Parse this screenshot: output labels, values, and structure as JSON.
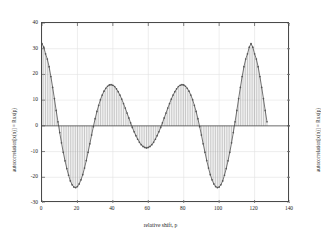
{
  "figure": {
    "background": "#ffffff",
    "axis_color": "#4a4a4a",
    "grid_color": "#e2e2e2",
    "stem_color": "#9a9a9a",
    "marker_color": "#555555",
    "curve_color": "#3a3a3a"
  },
  "chart_data": {
    "type": "bar",
    "title": "",
    "xlabel": "relative shift, p",
    "ylabel": "autocorrelation[x(n)] = Rxx(p)",
    "ylabel_right": "autocorrelation[x(n)] = Rxx(p)",
    "xlim": [
      0,
      140
    ],
    "ylim": [
      -30,
      40
    ],
    "xticks": [
      0,
      20,
      40,
      60,
      80,
      100,
      120,
      140
    ],
    "yticks": [
      -30,
      -20,
      -10,
      0,
      10,
      20,
      30,
      40
    ],
    "grid": true,
    "legend": null,
    "marker": "dot",
    "note": "stem plot of autocorrelation, symmetric about p=64, samples p=0..127",
    "x": [
      0,
      1,
      2,
      3,
      4,
      5,
      6,
      7,
      8,
      9,
      10,
      11,
      12,
      13,
      14,
      15,
      16,
      17,
      18,
      19,
      20,
      21,
      22,
      23,
      24,
      25,
      26,
      27,
      28,
      29,
      30,
      31,
      32,
      33,
      34,
      35,
      36,
      37,
      38,
      39,
      40,
      41,
      42,
      43,
      44,
      45,
      46,
      47,
      48,
      49,
      50,
      51,
      52,
      53,
      54,
      55,
      56,
      57,
      58,
      59,
      60,
      61,
      62,
      63,
      64,
      65,
      66,
      67,
      68,
      69,
      70,
      71,
      72,
      73,
      74,
      75,
      76,
      77,
      78,
      79,
      80,
      81,
      82,
      83,
      84,
      85,
      86,
      87,
      88,
      89,
      90,
      91,
      92,
      93,
      94,
      95,
      96,
      97,
      98,
      99,
      100,
      101,
      102,
      103,
      104,
      105,
      106,
      107,
      108,
      109,
      110,
      111,
      112,
      113,
      114,
      115,
      116,
      117,
      118,
      119,
      120,
      121,
      122,
      123,
      124,
      125,
      126,
      127
    ],
    "values": [
      32.0,
      30.6,
      28.0,
      26.0,
      23.0,
      19.2,
      15.0,
      10.6,
      6.0,
      1.6,
      -2.6,
      -6.6,
      -10.3,
      -13.6,
      -16.6,
      -19.2,
      -21.4,
      -22.9,
      -23.8,
      -24.0,
      -23.6,
      -22.6,
      -21.0,
      -19.0,
      -16.4,
      -13.5,
      -10.3,
      -7.0,
      -3.6,
      -0.3,
      2.8,
      5.6,
      8.0,
      10.2,
      12.0,
      13.5,
      14.6,
      15.4,
      15.9,
      16.0,
      15.8,
      15.3,
      14.4,
      13.3,
      12.0,
      10.4,
      8.7,
      6.9,
      5.0,
      3.1,
      1.2,
      -0.6,
      -2.3,
      -3.8,
      -5.2,
      -6.4,
      -7.3,
      -8.0,
      -8.4,
      -8.6,
      -8.4,
      -8.0,
      -7.3,
      -6.4,
      -5.2,
      -3.8,
      -2.3,
      -0.6,
      1.2,
      3.1,
      5.0,
      6.9,
      8.7,
      10.4,
      12.0,
      13.3,
      14.4,
      15.3,
      15.8,
      16.0,
      15.9,
      15.4,
      14.6,
      13.5,
      12.0,
      10.2,
      8.0,
      5.6,
      2.8,
      -0.3,
      -3.6,
      -7.0,
      -10.3,
      -13.5,
      -16.4,
      -19.0,
      -21.0,
      -22.6,
      -23.6,
      -24.0,
      -23.8,
      -22.9,
      -21.4,
      -19.2,
      -16.6,
      -13.6,
      -10.3,
      -6.6,
      -2.6,
      1.6,
      6.0,
      10.6,
      15.0,
      19.2,
      23.0,
      26.0,
      28.0,
      30.6,
      32.0,
      30.6,
      28.0,
      26.0,
      23.0,
      19.2,
      15.0,
      10.6,
      6.0,
      1.6
    ],
    "values_note": "approximate read-off; curve is a beat-modulated cosine envelope"
  },
  "ticks": {
    "y": [
      "40",
      "30",
      "20",
      "10",
      "0",
      "-10",
      "-20",
      "-30"
    ],
    "x": [
      "0",
      "20",
      "40",
      "60",
      "80",
      "100",
      "120",
      "140"
    ]
  }
}
